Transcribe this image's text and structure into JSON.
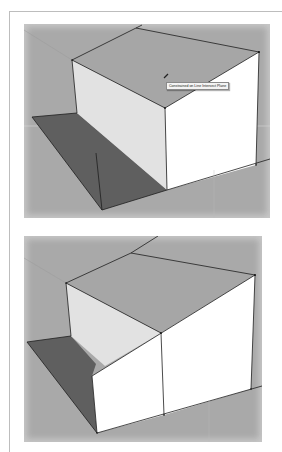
{
  "app": "SketchUp",
  "panels": [
    {
      "id": "top",
      "tooltip": "Constrained on Line Intersect Plane",
      "cursor_icon": "pencil-icon"
    },
    {
      "id": "bottom"
    }
  ],
  "colors": {
    "background": "#a9a9a9",
    "top_face": "#a5a5a5",
    "side_face": "#e4e4e4",
    "front_face": "#ffffff",
    "shadow": "#5e5e5e",
    "edge": "#222222"
  }
}
